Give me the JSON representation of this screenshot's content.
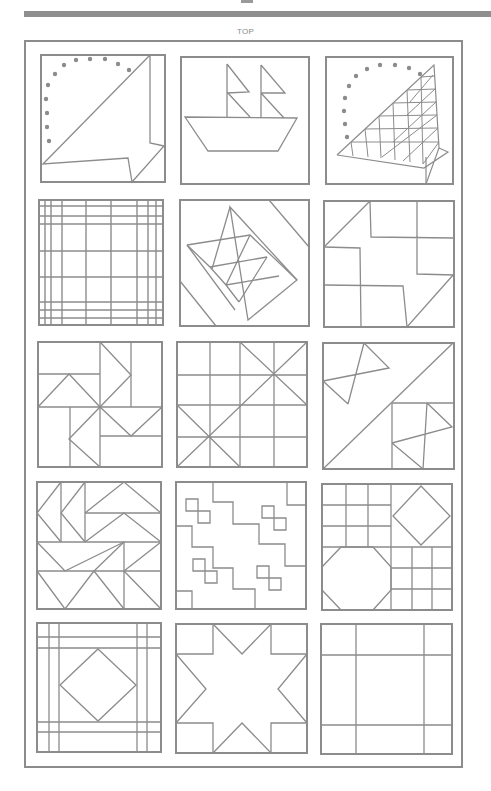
{
  "header": {
    "top_label": "TOP"
  },
  "layout": {
    "rows": 5,
    "columns": 3,
    "line_color": "#8c8c8c",
    "background": "#ffffff"
  },
  "blocks": [
    {
      "row": 1,
      "col": 1,
      "name": "folded-corner-with-dotted-arc",
      "label": ""
    },
    {
      "row": 1,
      "col": 2,
      "name": "sailboat-two-sails",
      "label": ""
    },
    {
      "row": 1,
      "col": 3,
      "name": "triangle-lattice-with-dotted-arc",
      "label": ""
    },
    {
      "row": 2,
      "col": 1,
      "name": "plaid-grid",
      "label": ""
    },
    {
      "row": 2,
      "col": 2,
      "name": "diamond-lattice-diagonal-bands",
      "label": ""
    },
    {
      "row": 2,
      "col": 3,
      "name": "pinwheel-star-squares",
      "label": ""
    },
    {
      "row": 3,
      "col": 1,
      "name": "pinwheel-rectangles",
      "label": ""
    },
    {
      "row": 3,
      "col": 2,
      "name": "four-by-four-grid-with-diagonals",
      "label": ""
    },
    {
      "row": 3,
      "col": 3,
      "name": "diagonal-split-with-bowties",
      "label": ""
    },
    {
      "row": 4,
      "col": 1,
      "name": "flying-geese-triangles",
      "label": ""
    },
    {
      "row": 4,
      "col": 2,
      "name": "staircase-with-four-patch",
      "label": ""
    },
    {
      "row": 4,
      "col": 3,
      "name": "nine-patch-diamond-octagon",
      "label": ""
    },
    {
      "row": 5,
      "col": 1,
      "name": "diamond-in-square-striped-border",
      "label": ""
    },
    {
      "row": 5,
      "col": 2,
      "name": "eight-point-star",
      "label": ""
    },
    {
      "row": 5,
      "col": 3,
      "name": "nine-patch-frame",
      "label": ""
    }
  ]
}
